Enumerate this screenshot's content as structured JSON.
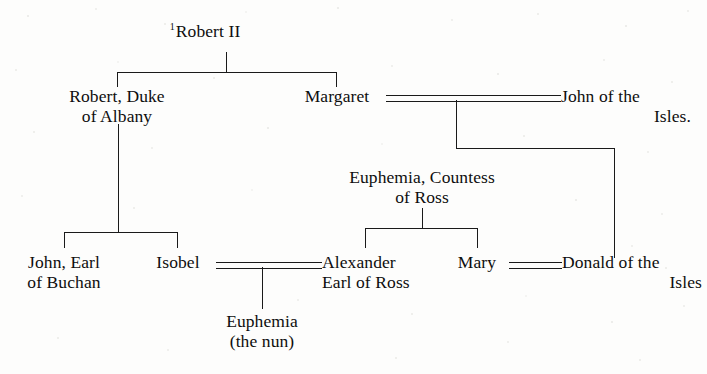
{
  "page": {
    "kind": "genealogical-tree",
    "background_color": "#fdfdfc",
    "ink_color": "#1a1a1a"
  },
  "nodes": {
    "robert_ii": {
      "marker": "1",
      "line1": "Robert II"
    },
    "robert_albany": {
      "line1": "Robert, Duke",
      "line2": "of Albany"
    },
    "margaret": {
      "line1": "Margaret"
    },
    "john_isles": {
      "line1": "John of the",
      "line2": "Isles."
    },
    "euphemia_ross": {
      "line1": "Euphemia, Countess",
      "line2": "of Ross"
    },
    "john_buchan": {
      "line1": "John, Earl",
      "line2": "of Buchan"
    },
    "isobel": {
      "line1": "Isobel"
    },
    "alexander_ross": {
      "line1": "Alexander",
      "line2": "Earl of Ross"
    },
    "mary": {
      "line1": "Mary"
    },
    "donald_isles": {
      "line1": "Donald of the",
      "line2": "Isles"
    },
    "euphemia_nun": {
      "line1": "Euphemia",
      "line2": "(the nun)"
    }
  }
}
